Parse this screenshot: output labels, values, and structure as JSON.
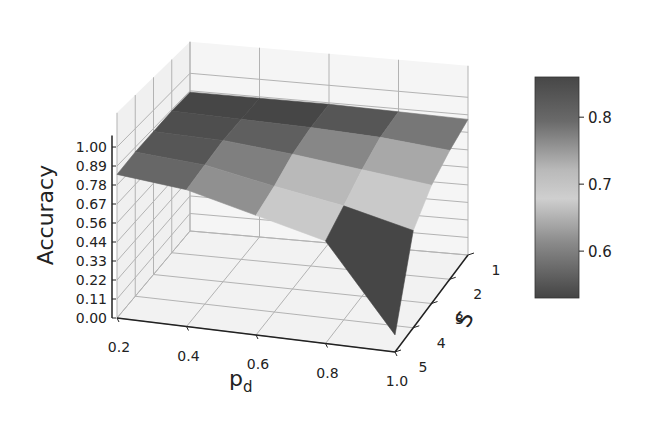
{
  "chart_data": {
    "type": "surface3d",
    "title": "",
    "xlabel": "p_d",
    "ylabel": "S",
    "zlabel": "Accuracy",
    "x": [
      0.2,
      0.4,
      0.6,
      0.8,
      1.0
    ],
    "y": [
      1,
      2,
      3,
      4,
      5
    ],
    "z_ticks": [
      "0.00",
      "0.11",
      "0.22",
      "0.33",
      "0.44",
      "0.56",
      "0.67",
      "0.78",
      "0.89",
      "1.00"
    ],
    "x_ticks": [
      "0.2",
      "0.4",
      "0.6",
      "0.8",
      "1.0"
    ],
    "y_ticks": [
      "1",
      "2",
      "3",
      "4",
      "5"
    ],
    "zlim": [
      0.0,
      1.0
    ],
    "grid": true,
    "colormap": "grayscale (dark at extremes, light mid)",
    "z_by_S_rows": [
      [
        0.88,
        0.88,
        0.88,
        0.87,
        0.86
      ],
      [
        0.88,
        0.87,
        0.86,
        0.84,
        0.8
      ],
      [
        0.87,
        0.86,
        0.82,
        0.77,
        0.72
      ],
      [
        0.86,
        0.83,
        0.75,
        0.68,
        0.58
      ],
      [
        0.84,
        0.8,
        0.7,
        0.6,
        0.1
      ]
    ],
    "patch_values": [
      [
        0.86,
        0.86,
        0.84,
        0.8
      ],
      [
        0.85,
        0.83,
        0.78,
        0.74
      ],
      [
        0.84,
        0.79,
        0.72,
        0.7
      ],
      [
        0.82,
        0.77,
        0.7,
        0.52
      ]
    ],
    "colorbar": {
      "ticks": [
        "0.6",
        "0.7",
        "0.8"
      ],
      "range": [
        0.53,
        0.86
      ],
      "position": "right"
    }
  },
  "labels": {
    "zlabel": "Accuracy",
    "xlabel_main": "p",
    "xlabel_sub": "d",
    "ylabel": "S"
  }
}
